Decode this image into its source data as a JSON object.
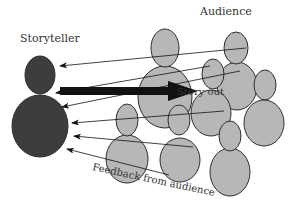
{
  "labels": {
    "storyteller": "Storyteller",
    "audience": "Audience",
    "story_out": "Story out",
    "feedback": "Feedback from audience"
  },
  "colors": {
    "storyteller_fill": "#3d3d3d",
    "audience_fill": "#b7b7b7",
    "stroke": "#2e2e2e",
    "arrow": "#111111"
  },
  "storyteller": {
    "head": {
      "cx": 40,
      "cy": 75,
      "rx": 15,
      "ry": 19
    },
    "body": {
      "cx": 40,
      "cy": 126,
      "rx": 28,
      "ry": 31
    }
  },
  "audience": [
    {
      "id": "a1",
      "head": {
        "cx": 165,
        "cy": 48,
        "rx": 14,
        "ry": 19
      },
      "body": {
        "cx": 165,
        "cy": 97,
        "rx": 27,
        "ry": 31
      }
    },
    {
      "id": "a2",
      "head": {
        "cx": 236,
        "cy": 48,
        "rx": 12,
        "ry": 16
      },
      "body": {
        "cx": 237,
        "cy": 86,
        "rx": 20,
        "ry": 24
      }
    },
    {
      "id": "a3",
      "head": {
        "cx": 213,
        "cy": 74,
        "rx": 11,
        "ry": 15
      },
      "body": {
        "cx": 211,
        "cy": 113,
        "rx": 20,
        "ry": 23
      }
    },
    {
      "id": "a4",
      "head": {
        "cx": 265,
        "cy": 85,
        "rx": 11,
        "ry": 15
      },
      "body": {
        "cx": 264,
        "cy": 123,
        "rx": 20,
        "ry": 23
      }
    },
    {
      "id": "a5",
      "head": {
        "cx": 127,
        "cy": 120,
        "rx": 11,
        "ry": 16
      },
      "body": {
        "cx": 127,
        "cy": 159,
        "rx": 21,
        "ry": 24
      }
    },
    {
      "id": "a6",
      "head": {
        "cx": 179,
        "cy": 120,
        "rx": 11,
        "ry": 15
      },
      "body": {
        "cx": 180,
        "cy": 160,
        "rx": 20,
        "ry": 22
      }
    },
    {
      "id": "a7",
      "head": {
        "cx": 230,
        "cy": 136,
        "rx": 11,
        "ry": 15
      },
      "body": {
        "cx": 230,
        "cy": 172,
        "rx": 20,
        "ry": 24
      }
    }
  ],
  "story_arrow": {
    "x1": 60,
    "y1": 91,
    "x2": 198,
    "y2": 91
  },
  "feedback_arrows": [
    {
      "x1": 246,
      "y1": 48,
      "x2": 60,
      "y2": 66
    },
    {
      "x1": 210,
      "y1": 66,
      "x2": 56,
      "y2": 93
    },
    {
      "x1": 240,
      "y1": 71,
      "x2": 62,
      "y2": 107
    },
    {
      "x1": 224,
      "y1": 111,
      "x2": 72,
      "y2": 123
    },
    {
      "x1": 193,
      "y1": 147,
      "x2": 74,
      "y2": 136
    },
    {
      "x1": 169,
      "y1": 175,
      "x2": 67,
      "y2": 149
    }
  ]
}
